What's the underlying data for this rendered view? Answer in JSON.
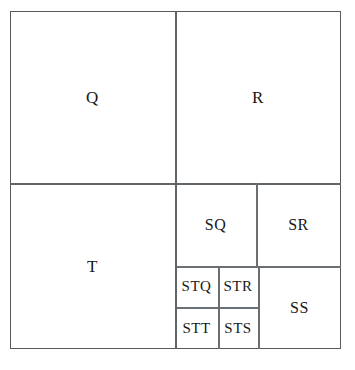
{
  "figure": {
    "type": "recursive-partition-diagram",
    "frame": {
      "stroke_color": "#555a5e",
      "fill_color": "#ffffff",
      "x": 10,
      "y": 11,
      "width": 331,
      "height": 338
    },
    "regions": [
      {
        "id": "Q",
        "label": "Q",
        "x": 10,
        "y": 11,
        "width": 165,
        "height": 172,
        "size": "lbl-lg"
      },
      {
        "id": "R",
        "label": "R",
        "x": 175,
        "y": 11,
        "width": 166,
        "height": 172,
        "size": "lbl-lg"
      },
      {
        "id": "T",
        "label": "T",
        "x": 10,
        "y": 183,
        "width": 165,
        "height": 166,
        "size": "lbl-lg"
      },
      {
        "id": "SQ",
        "label": "SQ",
        "x": 175,
        "y": 183,
        "width": 81,
        "height": 83,
        "size": "lbl-md"
      },
      {
        "id": "SR",
        "label": "SR",
        "x": 256,
        "y": 183,
        "width": 85,
        "height": 83,
        "size": "lbl-md"
      },
      {
        "id": "SS",
        "label": "SS",
        "x": 258,
        "y": 266,
        "width": 83,
        "height": 83,
        "size": "lbl-md"
      },
      {
        "id": "STQ",
        "label": "STQ",
        "x": 175,
        "y": 266,
        "width": 43,
        "height": 41,
        "size": "lbl-sm"
      },
      {
        "id": "STR",
        "label": "STR",
        "x": 218,
        "y": 266,
        "width": 40,
        "height": 41,
        "size": "lbl-sm"
      },
      {
        "id": "STT",
        "label": "STT",
        "x": 175,
        "y": 307,
        "width": 43,
        "height": 42,
        "size": "lbl-sm"
      },
      {
        "id": "STS",
        "label": "STS",
        "x": 218,
        "y": 307,
        "width": 40,
        "height": 42,
        "size": "lbl-sm"
      }
    ],
    "dividers": {
      "horizontal": [
        {
          "name": "top-bottom-split",
          "x": 10,
          "y": 183,
          "length": 331
        },
        {
          "name": "sq-sr-bottom",
          "x": 175,
          "y": 266,
          "length": 166
        },
        {
          "name": "stq-stt-split",
          "x": 175,
          "y": 307,
          "length": 83
        }
      ],
      "vertical": [
        {
          "name": "q-r-split",
          "x": 175,
          "y": 11,
          "length": 172
        },
        {
          "name": "t-right-split",
          "x": 175,
          "y": 183,
          "length": 166
        },
        {
          "name": "sq-sr-split",
          "x": 256,
          "y": 183,
          "length": 83
        },
        {
          "name": "st-block-right",
          "x": 258,
          "y": 266,
          "length": 83
        },
        {
          "name": "stq-str-split",
          "x": 218,
          "y": 266,
          "length": 83
        }
      ]
    }
  }
}
